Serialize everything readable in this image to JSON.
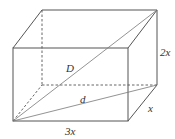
{
  "diagram": {
    "type": "rectangular-prism",
    "labels": {
      "space_diagonal": "D",
      "base_diagonal": "d",
      "height": "2x",
      "depth": "x",
      "length": "3x"
    }
  }
}
